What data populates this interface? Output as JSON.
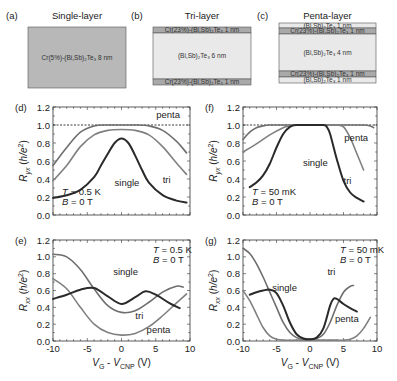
{
  "schematics": [
    {
      "panel": "(a)",
      "title": "Single-layer",
      "box": {
        "x": 28,
        "y": 27,
        "w": 98,
        "h": 61
      },
      "layers": [
        {
          "label": "Cr(5%)-(Bi,Sb)₂Te₃ 8 nm",
          "h": 61,
          "fill": "#b8b8b8"
        }
      ]
    },
    {
      "panel": "(b)",
      "title": "Tri-layer",
      "box": {
        "x": 153,
        "y": 27,
        "w": 98,
        "h": 58
      },
      "layers": [
        {
          "label": "Cr(23%)-(Bi,Sb)₂Te₃ 1 nm",
          "h": 6,
          "fill": "#a9a9a9"
        },
        {
          "label": "(Bi,Sb)₂Te₃ 6 nm",
          "h": 46,
          "fill": "#e9e9e9"
        },
        {
          "label": "Cr(23%)-(Bi,Sb)₂Te₃ 1 nm",
          "h": 6,
          "fill": "#a9a9a9"
        }
      ]
    },
    {
      "panel": "(c)",
      "title": "Penta-layer",
      "box": {
        "x": 279,
        "y": 23,
        "w": 97,
        "h": 60
      },
      "layers": [
        {
          "label": "(Bi,Sb)₂Te₃ 1 nm",
          "h": 5,
          "fill": "#e9e9e9"
        },
        {
          "label": "Cr(23%)-(Bi,Sb)₂Te₃ 1 nm",
          "h": 6,
          "fill": "#a9a9a9"
        },
        {
          "label": "(Bi,Sb)₂Te₃ 4 nm",
          "h": 37,
          "fill": "#e9e9e9"
        },
        {
          "label": "Cr(23%)-(Bi,Sb)₂Te₃ 1 nm",
          "h": 6,
          "fill": "#a9a9a9"
        },
        {
          "label": "(Bi,Sb)₂Te₃ 1 nm",
          "h": 6,
          "fill": "#e9e9e9"
        }
      ]
    }
  ],
  "chart_data": [
    {
      "panel": "(d)",
      "type": "line",
      "ylabel": "R_yx (h/e²)",
      "xlabel": "",
      "xlim": [
        -10,
        10
      ],
      "ylim": [
        0,
        1.2
      ],
      "yticks": [
        "0.0",
        "0.2",
        "0.4",
        "0.6",
        "0.8",
        "1.0",
        "1.2"
      ],
      "xticks": [],
      "annotation": [
        "T = 0.5 K",
        "B = 0 T"
      ],
      "reference_line": 1.0,
      "frame": {
        "x0": 53,
        "x1": 190,
        "y0": 215,
        "y1": 107
      },
      "series": [
        {
          "name": "penta",
          "color": "#6e6e6e",
          "width": 1.6,
          "x": [
            -10,
            -8,
            -6,
            -4,
            -2,
            0,
            2,
            4,
            6,
            8,
            9.5
          ],
          "y": [
            0.55,
            0.75,
            0.92,
            0.99,
            1.0,
            1.0,
            1.0,
            0.99,
            0.94,
            0.82,
            0.69
          ]
        },
        {
          "name": "tri",
          "color": "#808080",
          "width": 1.6,
          "x": [
            -10,
            -8,
            -6,
            -4,
            -2,
            0,
            2,
            4,
            6,
            8,
            9.5
          ],
          "y": [
            0.38,
            0.55,
            0.76,
            0.89,
            0.94,
            0.95,
            0.94,
            0.89,
            0.76,
            0.58,
            0.45
          ]
        },
        {
          "name": "single",
          "color": "#2a2a2a",
          "width": 2.0,
          "x": [
            -10,
            -8,
            -6,
            -4,
            -3,
            -2,
            -1,
            0,
            1,
            2,
            3,
            4,
            6,
            8,
            9.5
          ],
          "y": [
            0.19,
            0.22,
            0.28,
            0.42,
            0.55,
            0.68,
            0.8,
            0.85,
            0.8,
            0.66,
            0.5,
            0.36,
            0.22,
            0.16,
            0.14
          ]
        }
      ],
      "labels": [
        {
          "text": "penta",
          "x": 6.8,
          "y": 1.08
        },
        {
          "text": "tri",
          "x": 6.6,
          "y": 0.36
        },
        {
          "text": "single",
          "x": 0.8,
          "y": 0.32
        }
      ]
    },
    {
      "panel": "(e)",
      "type": "line",
      "ylabel": "R_xx (h/e²)",
      "xlabel": "V_G - V_CNP (V)",
      "xlim": [
        -10,
        10
      ],
      "ylim": [
        0,
        1.2
      ],
      "yticks": [
        "0.0",
        "0.2",
        "0.4",
        "0.6",
        "0.8",
        "1.0",
        "1.2"
      ],
      "xticks": [
        "-10",
        "-5",
        "0",
        "5",
        "10"
      ],
      "annotation": [
        "T = 0.5 K",
        "B = 0 T"
      ],
      "frame": {
        "x0": 53,
        "x1": 190,
        "y0": 341,
        "y1": 240
      },
      "series": [
        {
          "name": "penta",
          "color": "#808080",
          "width": 1.6,
          "x": [
            -10,
            -8,
            -6,
            -4,
            -2,
            0,
            2,
            4,
            6,
            8,
            9.5
          ],
          "y": [
            0.74,
            0.62,
            0.4,
            0.2,
            0.1,
            0.07,
            0.09,
            0.17,
            0.3,
            0.45,
            0.56
          ]
        },
        {
          "name": "tri",
          "color": "#6e6e6e",
          "width": 1.6,
          "x": [
            -10,
            -8,
            -6,
            -4,
            -2,
            0,
            2,
            4,
            6,
            8,
            9
          ],
          "y": [
            1.03,
            1.0,
            0.85,
            0.62,
            0.42,
            0.34,
            0.36,
            0.46,
            0.58,
            0.65,
            0.64
          ]
        },
        {
          "name": "single",
          "color": "#2a2a2a",
          "width": 2.0,
          "x": [
            -10,
            -8,
            -6,
            -4,
            -2,
            0,
            2,
            3.5,
            5,
            7,
            8.5
          ],
          "y": [
            0.5,
            0.55,
            0.61,
            0.63,
            0.53,
            0.44,
            0.52,
            0.59,
            0.55,
            0.45,
            0.39
          ]
        }
      ],
      "labels": [
        {
          "text": "single",
          "x": 0.6,
          "y": 0.78
        },
        {
          "text": "tri",
          "x": 2.6,
          "y": 0.26
        },
        {
          "text": "penta",
          "x": 5.4,
          "y": 0.1
        }
      ]
    },
    {
      "panel": "(f)",
      "type": "line",
      "ylabel": "R_yx (h/e²)",
      "xlabel": "",
      "xlim": [
        -10,
        10
      ],
      "ylim": [
        0,
        1.2
      ],
      "yticks": [
        "0.0",
        "0.2",
        "0.4",
        "0.6",
        "0.8",
        "1.0",
        "1.2"
      ],
      "xticks": [],
      "annotation": [
        "T = 50 mK",
        "B = 0 T"
      ],
      "reference_line": 1.0,
      "frame": {
        "x0": 243,
        "x1": 377,
        "y0": 215,
        "y1": 107
      },
      "series": [
        {
          "name": "penta",
          "color": "#6e6e6e",
          "width": 1.6,
          "x": [
            -10,
            -9,
            -8,
            -7,
            -6,
            -4,
            0,
            4,
            6,
            8,
            9,
            9.5
          ],
          "y": [
            0.84,
            0.92,
            0.97,
            0.99,
            1.0,
            1.0,
            1.0,
            1.0,
            1.0,
            1.0,
            0.99,
            0.97
          ]
        },
        {
          "name": "tri",
          "color": "#808080",
          "width": 1.6,
          "x": [
            -10,
            -8,
            -6,
            -4,
            -3,
            -2,
            0,
            2,
            4,
            5,
            6,
            7,
            8
          ],
          "y": [
            0.7,
            0.79,
            0.89,
            0.97,
            0.99,
            1.0,
            1.0,
            1.0,
            1.0,
            0.98,
            0.86,
            0.68,
            0.5
          ]
        },
        {
          "name": "single",
          "color": "#2a2a2a",
          "width": 2.0,
          "x": [
            -9,
            -8,
            -7,
            -6,
            -5,
            -4,
            -3,
            -2,
            0,
            2,
            2.5,
            3,
            4,
            5,
            6,
            7,
            8
          ],
          "y": [
            0.31,
            0.36,
            0.44,
            0.57,
            0.75,
            0.9,
            0.98,
            1.0,
            1.0,
            1.0,
            0.98,
            0.9,
            0.62,
            0.38,
            0.25,
            0.19,
            0.15
          ]
        }
      ],
      "labels": [
        {
          "text": "penta",
          "x": 6.9,
          "y": 0.82
        },
        {
          "text": "single",
          "x": 0.8,
          "y": 0.54
        },
        {
          "text": "tri",
          "x": 5.6,
          "y": 0.35
        }
      ]
    },
    {
      "panel": "(g)",
      "type": "line",
      "ylabel": "R_xx (h/e²)",
      "xlabel": "V_G - V_CNP (V)",
      "xlim": [
        -10,
        10
      ],
      "ylim": [
        0,
        1.2
      ],
      "yticks": [
        "0.0",
        "0.2",
        "0.4",
        "0.6",
        "0.8",
        "1.0",
        "1.2"
      ],
      "xticks": [
        "-10",
        "-5",
        "0",
        "5",
        "10"
      ],
      "annotation": [
        "T = 50 mK",
        "B = 0 T"
      ],
      "frame": {
        "x0": 243,
        "x1": 377,
        "y0": 341,
        "y1": 240
      },
      "series": [
        {
          "name": "penta",
          "color": "#808080",
          "width": 1.6,
          "x": [
            -10,
            -9,
            -8,
            -7,
            -6,
            -5,
            -4,
            -2,
            0,
            2,
            4,
            5,
            6,
            7,
            8,
            9
          ],
          "y": [
            0.6,
            0.48,
            0.32,
            0.16,
            0.06,
            0.02,
            0.01,
            0.01,
            0.01,
            0.01,
            0.01,
            0.01,
            0.02,
            0.06,
            0.15,
            0.28
          ]
        },
        {
          "name": "tri",
          "color": "#6e6e6e",
          "width": 1.6,
          "x": [
            -10,
            -9,
            -8,
            -7,
            -6,
            -5,
            -4,
            -3,
            -2,
            -1,
            0,
            1,
            2,
            3,
            4,
            5,
            6,
            6.5
          ],
          "y": [
            1.1,
            1.04,
            0.92,
            0.76,
            0.58,
            0.4,
            0.22,
            0.1,
            0.04,
            0.02,
            0.02,
            0.03,
            0.08,
            0.22,
            0.42,
            0.58,
            0.65,
            0.66
          ]
        },
        {
          "name": "single",
          "color": "#2a2a2a",
          "width": 2.0,
          "x": [
            -9,
            -8,
            -7,
            -6,
            -5,
            -4,
            -3,
            -2,
            -1,
            0,
            1,
            2,
            3,
            3.5,
            4,
            5,
            6,
            7
          ],
          "y": [
            0.55,
            0.58,
            0.6,
            0.61,
            0.57,
            0.42,
            0.22,
            0.08,
            0.03,
            0.02,
            0.04,
            0.15,
            0.42,
            0.5,
            0.5,
            0.44,
            0.39,
            0.35
          ]
        }
      ],
      "labels": [
        {
          "text": "tri",
          "x": 3.2,
          "y": 0.78
        },
        {
          "text": "single",
          "x": -3.8,
          "y": 0.6
        },
        {
          "text": "penta",
          "x": 5.5,
          "y": 0.22
        }
      ]
    }
  ]
}
